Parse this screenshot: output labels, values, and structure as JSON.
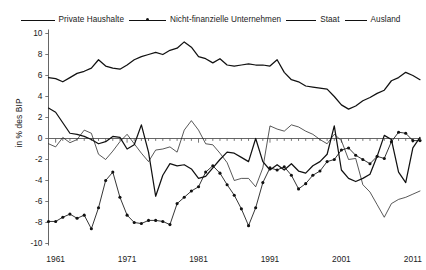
{
  "legend": {
    "items": [
      {
        "label": "Private Haushalte",
        "style": "thick-line",
        "marker": "none",
        "swatch": "sw-ph"
      },
      {
        "label": "Nicht-finanzielle Unternehmen",
        "style": "thin-line",
        "marker": "dot",
        "swatch": "sw-nfu"
      },
      {
        "label": "Staat",
        "style": "thick-line",
        "marker": "none",
        "swatch": "sw-staat"
      },
      {
        "label": "Ausland",
        "style": "thin-line",
        "marker": "none",
        "swatch": "sw-ausland"
      }
    ]
  },
  "axes": {
    "ylabel": "in % des BIP",
    "yticks": [
      "10",
      "8",
      "6",
      "4",
      "2",
      "0",
      "-2",
      "-4",
      "-6",
      "-8",
      "-10"
    ],
    "xticks": [
      "1961",
      "1971",
      "1981",
      "1991",
      "2001",
      "2011"
    ]
  },
  "chart_data": {
    "type": "line",
    "title": "",
    "xlabel": "",
    "ylabel": "in % des BIP",
    "xlim": [
      1960,
      2012
    ],
    "ylim": [
      -10,
      10
    ],
    "grid": false,
    "legend_position": "top",
    "x": [
      1960,
      1961,
      1962,
      1963,
      1964,
      1965,
      1966,
      1967,
      1968,
      1969,
      1970,
      1971,
      1972,
      1973,
      1974,
      1975,
      1976,
      1977,
      1978,
      1979,
      1980,
      1981,
      1982,
      1983,
      1984,
      1985,
      1986,
      1987,
      1988,
      1989,
      1990,
      1991,
      1992,
      1993,
      1994,
      1995,
      1996,
      1997,
      1998,
      1999,
      2000,
      2001,
      2002,
      2003,
      2004,
      2005,
      2006,
      2007,
      2008,
      2009,
      2010,
      2011,
      2012
    ],
    "series": [
      {
        "name": "Private Haushalte",
        "values": [
          5.8,
          5.7,
          5.4,
          5.8,
          6.2,
          6.4,
          6.7,
          7.5,
          6.9,
          6.7,
          6.6,
          7.0,
          7.5,
          7.8,
          8.0,
          8.2,
          8.0,
          8.4,
          8.6,
          9.2,
          8.7,
          7.8,
          7.6,
          7.2,
          7.6,
          7.0,
          6.9,
          7.0,
          7.1,
          7.0,
          7.0,
          6.9,
          7.5,
          6.3,
          5.6,
          5.4,
          5.0,
          4.9,
          4.8,
          4.7,
          4.0,
          3.2,
          2.8,
          3.1,
          3.6,
          3.9,
          4.3,
          4.6,
          5.5,
          5.8,
          6.3,
          6.0,
          5.6
        ],
        "marker": false,
        "width": "thick"
      },
      {
        "name": "Nicht-finanzielle Unternehmen",
        "values": [
          -7.9,
          -7.9,
          -7.5,
          -7.2,
          -7.6,
          -7.3,
          -8.6,
          -6.6,
          -4.0,
          -3.2,
          -5.6,
          -7.3,
          -8.0,
          -8.1,
          -7.8,
          -7.8,
          -7.9,
          -8.2,
          -6.2,
          -5.6,
          -5.0,
          -4.6,
          -3.2,
          -2.6,
          -3.3,
          -4.4,
          -5.4,
          -6.7,
          -8.3,
          -6.6,
          -4.2,
          -2.8,
          -3.0,
          -2.7,
          -3.5,
          -4.8,
          -4.3,
          -3.5,
          -3.1,
          -2.2,
          -2.0,
          -1.1,
          -0.9,
          -1.6,
          -2.0,
          -2.4,
          -1.7,
          -1.9,
          -0.3,
          0.6,
          0.5,
          -0.2,
          -0.2
        ],
        "marker": true,
        "width": "thin"
      },
      {
        "name": "Staat",
        "values": [
          2.9,
          2.5,
          1.5,
          0.5,
          0.4,
          0.2,
          -0.1,
          -0.5,
          -0.3,
          0.2,
          0.1,
          -1.0,
          -0.6,
          1.3,
          -1.3,
          -5.5,
          -3.5,
          -2.4,
          -2.6,
          -2.5,
          -2.9,
          -3.8,
          -3.6,
          -2.8,
          -2.0,
          -1.3,
          -1.4,
          -1.8,
          -2.2,
          0.0,
          -2.2,
          -3.0,
          -2.5,
          -3.0,
          -2.4,
          -3.1,
          -3.3,
          -2.6,
          -2.2,
          -1.5,
          1.2,
          -3.0,
          -3.8,
          -4.1,
          -3.8,
          -3.4,
          -1.7,
          0.3,
          -0.1,
          -3.2,
          -4.2,
          -0.9,
          0.1
        ],
        "marker": false,
        "width": "thick"
      },
      {
        "name": "Ausland",
        "values": [
          -0.5,
          -0.8,
          0.1,
          -0.4,
          -0.1,
          0.8,
          0.5,
          -1.5,
          -2.0,
          -1.2,
          -0.3,
          0.4,
          -0.5,
          -1.4,
          -2.2,
          -1.1,
          -1.0,
          -0.8,
          -1.3,
          0.8,
          1.7,
          0.8,
          -0.5,
          -0.6,
          -1.4,
          -2.3,
          -4.0,
          -3.8,
          -3.8,
          -4.6,
          -2.8,
          1.2,
          0.9,
          0.7,
          1.3,
          1.1,
          0.7,
          0.4,
          -0.1,
          -0.5,
          0.4,
          -0.2,
          -2.0,
          -1.9,
          -4.4,
          -5.1,
          -6.3,
          -7.5,
          -6.2,
          -5.8,
          -5.6,
          -5.3,
          -5.0
        ],
        "marker": false,
        "width": "thin"
      }
    ]
  }
}
